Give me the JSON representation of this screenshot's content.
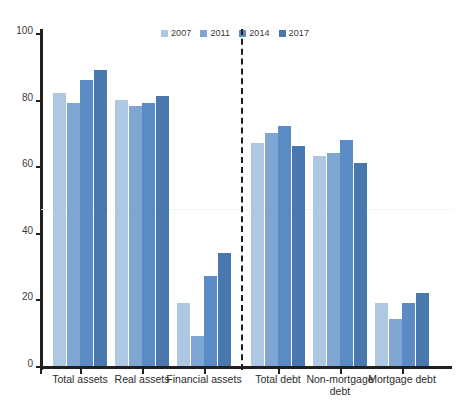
{
  "chart_data": {
    "type": "bar",
    "title": "",
    "subtitle": "",
    "xlabel": "",
    "ylabel": "",
    "ylim": [
      0,
      100
    ],
    "ytick_values": [
      0,
      20,
      40,
      60,
      80,
      100
    ],
    "ytick_labels": [
      "0",
      "20",
      "40",
      "60",
      "80",
      "100"
    ],
    "grid": false,
    "legend_position": "top-center",
    "categories": [
      "Total assets",
      "Real assets",
      "Financial assets",
      "Total debt",
      "Non-mortgage\ndebt",
      "Mortgage debt"
    ],
    "series": [
      {
        "name": "2007",
        "color": "#aec7e2",
        "values": [
          82,
          80,
          19,
          67,
          63,
          19
        ]
      },
      {
        "name": "2011",
        "color": "#7fa6d2",
        "values": [
          79,
          78,
          9,
          70,
          64,
          14
        ]
      },
      {
        "name": "2014",
        "color": "#5b8bc5",
        "values": [
          86,
          79,
          27,
          72,
          68,
          19
        ]
      },
      {
        "name": "2017",
        "color": "#4878ad",
        "values": [
          89,
          81,
          34,
          66,
          61,
          22
        ]
      }
    ],
    "annotations": [
      {
        "name": "assets-debt-divider",
        "type": "vertical-dashed-line",
        "between_categories": [
          "Financial assets",
          "Total debt"
        ]
      }
    ]
  },
  "legend": {
    "entries": [
      {
        "label": "2007",
        "color": "#aec7e2"
      },
      {
        "label": "2011",
        "color": "#7fa6d2"
      },
      {
        "label": "2014",
        "color": "#5b8bc5"
      },
      {
        "label": "2017",
        "color": "#4878ad"
      }
    ]
  },
  "axis": {
    "y_labels": [
      "100",
      "80",
      "60",
      "40",
      "20",
      "0"
    ]
  }
}
